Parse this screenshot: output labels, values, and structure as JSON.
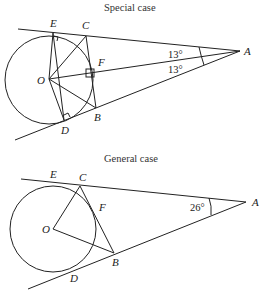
{
  "special": {
    "title": "Special case",
    "labels": {
      "E": "E",
      "C": "C",
      "A": "A",
      "F": "F",
      "O": "O",
      "B": "B",
      "D": "D"
    },
    "angle_top": "13°",
    "angle_bottom": "13°"
  },
  "general": {
    "title": "General case",
    "labels": {
      "E": "E",
      "C": "C",
      "A": "A",
      "F": "F",
      "O": "O",
      "B": "B",
      "D": "D"
    },
    "angle": "26°"
  }
}
